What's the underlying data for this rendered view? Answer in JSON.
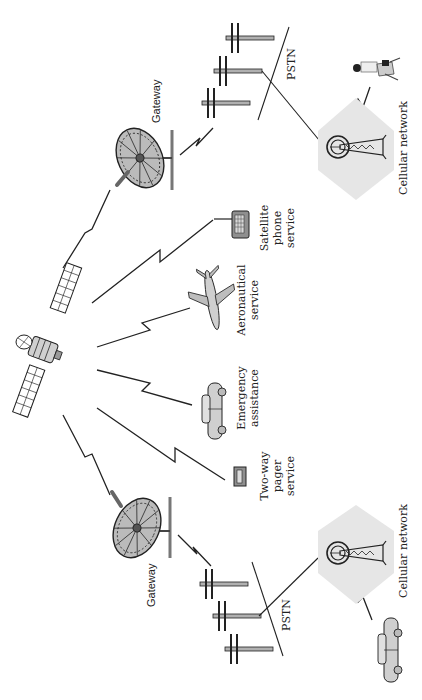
{
  "diagram": {
    "orientation": "rotated 90 degrees counter-clockwise (text reads bottom-to-top)",
    "colors": {
      "background": "#ffffff",
      "line": "#222222",
      "cell_hexagon": "#e6e6e6",
      "device_fill": "#9a9a9a",
      "pole_fill": "#b0b0b0"
    },
    "nodes": {
      "satellite": {
        "label": ""
      },
      "gateway_top": {
        "label": "Gateway"
      },
      "gateway_bottom": {
        "label": "Gateway"
      },
      "pstn_top": {
        "label": "PSTN"
      },
      "pstn_bottom": {
        "label": "PSTN"
      },
      "cellular_top": {
        "label": "Cellular network"
      },
      "cellular_bottom": {
        "label": "Cellular network"
      },
      "satellite_phone": {
        "label_lines": [
          "Satellite",
          "phone",
          "service"
        ]
      },
      "aeronautical": {
        "label_lines": [
          "Aeronautical",
          "service"
        ]
      },
      "emergency": {
        "label_lines": [
          "Emergency",
          "assistance"
        ]
      },
      "pager": {
        "label_lines": [
          "Two-way",
          "pager",
          "service"
        ]
      }
    },
    "links": [
      {
        "from": "satellite",
        "to": "gateway_top",
        "type": "wireless"
      },
      {
        "from": "satellite",
        "to": "satellite_phone",
        "type": "wireless"
      },
      {
        "from": "satellite",
        "to": "aeronautical",
        "type": "wireless"
      },
      {
        "from": "satellite",
        "to": "emergency",
        "type": "wireless"
      },
      {
        "from": "satellite",
        "to": "pager",
        "type": "wireless"
      },
      {
        "from": "satellite",
        "to": "gateway_bottom",
        "type": "wireless"
      },
      {
        "from": "gateway_top",
        "to": "pstn_top",
        "type": "wireless"
      },
      {
        "from": "gateway_bottom",
        "to": "pstn_bottom",
        "type": "wireless"
      },
      {
        "from": "pstn_top",
        "to": "cellular_top",
        "type": "wired"
      },
      {
        "from": "pstn_bottom",
        "to": "cellular_bottom",
        "type": "wired"
      },
      {
        "from": "cellular_top",
        "to": "mobile_user_laptop",
        "type": "wireless"
      },
      {
        "from": "cellular_bottom",
        "to": "car_user",
        "type": "wireless"
      }
    ]
  }
}
